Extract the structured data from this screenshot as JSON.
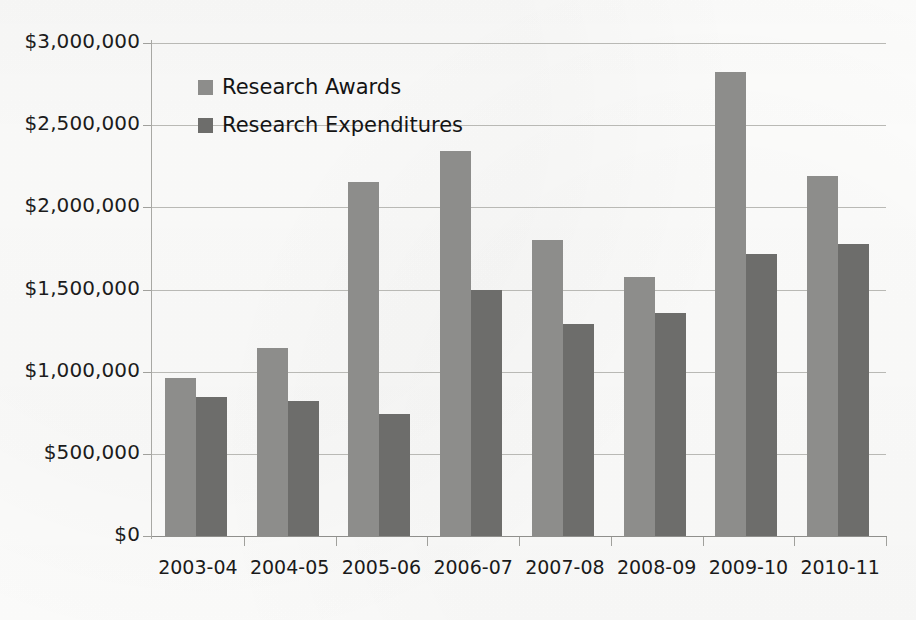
{
  "chart_data": {
    "type": "bar",
    "title": "",
    "subtitle": "",
    "xlabel": "",
    "ylabel": "",
    "categories": [
      "2003-04",
      "2004-05",
      "2005-06",
      "2006-07",
      "2007-08",
      "2008-09",
      "2009-10",
      "2010-11"
    ],
    "series": [
      {
        "name": "Research Awards",
        "color": "#8d8d8b",
        "values": [
          960000,
          1145000,
          2155000,
          2345000,
          1800000,
          1575000,
          2825000,
          2190000
        ]
      },
      {
        "name": "Research Expenditures",
        "color": "#6d6d6b",
        "values": [
          845000,
          820000,
          740000,
          1500000,
          1290000,
          1355000,
          1715000,
          1780000
        ]
      }
    ],
    "ylim": [
      0,
      3000000
    ],
    "ytick_values": [
      0,
      500000,
      1000000,
      1500000,
      2000000,
      2500000,
      3000000
    ],
    "ytick_labels": [
      "$0",
      "$500,000",
      "$1,000,000",
      "$1,500,000",
      "$2,000,000",
      "$2,500,000",
      "$3,000,000"
    ],
    "grid": true,
    "grid_axis": "y",
    "legend_position": "upper-left-inside",
    "annotations": []
  },
  "legend": {
    "items": [
      {
        "label": "Research Awards",
        "swatch": "awards"
      },
      {
        "label": "Research Expenditures",
        "swatch": "expenditures"
      }
    ]
  }
}
